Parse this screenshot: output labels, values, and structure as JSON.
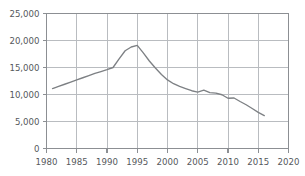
{
  "chart_data": {
    "type": "line",
    "title": "",
    "subtitle": "",
    "xlabel": "",
    "ylabel": "",
    "xlim": [
      1980,
      2020
    ],
    "ylim": [
      0,
      25000
    ],
    "grid": true,
    "legend": null,
    "x_ticks": [
      "1980",
      "1985",
      "1990",
      "1995",
      "2000",
      "2005",
      "2010",
      "2015",
      "2020"
    ],
    "x_tick_values": [
      1980,
      1985,
      1990,
      1995,
      2000,
      2005,
      2010,
      2015,
      2020
    ],
    "y_ticks": [
      "0",
      "5,000",
      "10,000",
      "15,000",
      "20,000",
      "25,000"
    ],
    "y_tick_values": [
      0,
      5000,
      10000,
      15000,
      20000,
      25000
    ],
    "series": [
      {
        "name": "series-1",
        "color": "#7d8084",
        "x": [
          1981,
          1982,
          1983,
          1984,
          1985,
          1986,
          1987,
          1988,
          1989,
          1990,
          1991,
          1992,
          1993,
          1994,
          1995,
          1996,
          1997,
          1998,
          1999,
          2000,
          2001,
          2002,
          2003,
          2004,
          2005,
          2006,
          2007,
          2008,
          2009,
          2010,
          2011,
          2012,
          2013,
          2014,
          2015,
          2016
        ],
        "values": [
          11100,
          11500,
          11900,
          12300,
          12700,
          13100,
          13500,
          13900,
          14250,
          14600,
          15000,
          16600,
          18100,
          18800,
          19100,
          17700,
          16200,
          14900,
          13700,
          12700,
          12000,
          11500,
          11100,
          10700,
          10450,
          10800,
          10350,
          10250,
          9950,
          9300,
          9350,
          8700,
          8100,
          7400,
          6700,
          6100
        ]
      }
    ]
  },
  "axes": {
    "line_color": "#8c8f93",
    "grid_color": "#b9bcc0",
    "label_color": "#55585c"
  }
}
